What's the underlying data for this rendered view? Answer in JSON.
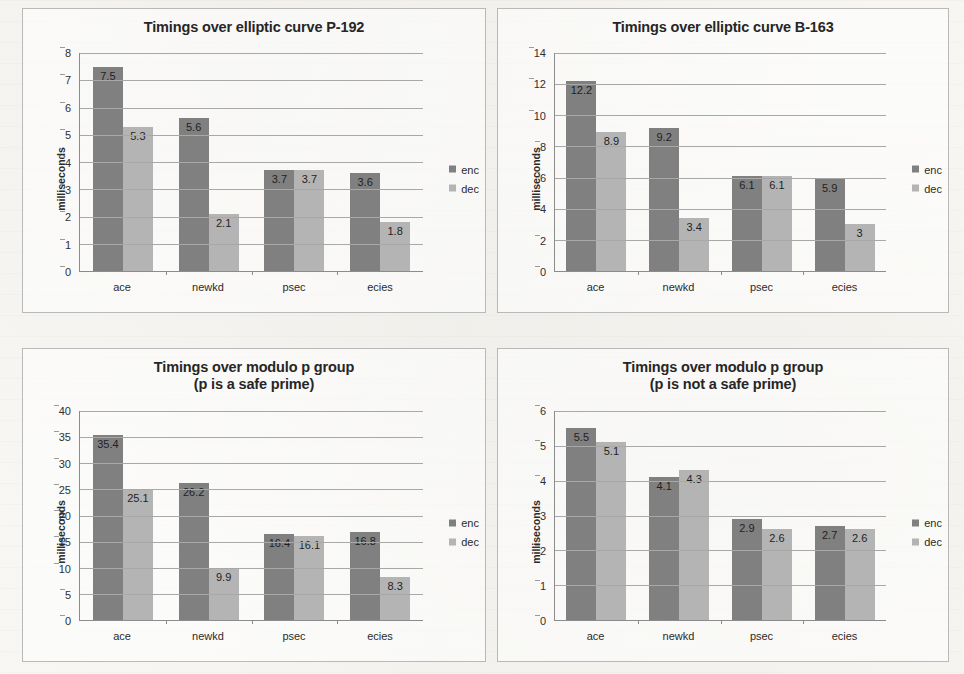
{
  "legend": {
    "enc_label": "enc",
    "dec_label": "dec"
  },
  "colors": {
    "enc": "#808080",
    "dec": "#b4b4b4",
    "panel_border": "#b9b9b9",
    "grid": "#a8a8a8",
    "axis": "#8c8c8c",
    "page_bg": "#f7f6f3"
  },
  "charts": [
    {
      "id": "elliptic-p192",
      "title": "Timings over elliptic curve P-192",
      "ylabel": "milliseconds",
      "chart_data": {
        "type": "bar",
        "title": "Timings over elliptic curve P-192",
        "xlabel": "",
        "ylabel": "milliseconds",
        "categories": [
          "ace",
          "newkd",
          "psec",
          "ecies"
        ],
        "series": [
          {
            "name": "enc",
            "values": [
              7.5,
              5.6,
              3.7,
              3.6
            ]
          },
          {
            "name": "dec",
            "values": [
              5.3,
              2.1,
              3.7,
              1.8
            ]
          }
        ],
        "ylim": [
          0,
          8
        ],
        "yticks": [
          0,
          1,
          2,
          3,
          4,
          5,
          6,
          7,
          8
        ],
        "grid": true,
        "legend_position": "right"
      }
    },
    {
      "id": "elliptic-b163",
      "title": "Timings over elliptic curve B-163",
      "ylabel": "milliseconds",
      "chart_data": {
        "type": "bar",
        "title": "Timings over elliptic curve B-163",
        "xlabel": "",
        "ylabel": "milliseconds",
        "categories": [
          "ace",
          "newkd",
          "psec",
          "ecies"
        ],
        "series": [
          {
            "name": "enc",
            "values": [
              12.2,
              9.2,
              6.1,
              5.9
            ]
          },
          {
            "name": "dec",
            "values": [
              8.9,
              3.4,
              6.1,
              3
            ]
          }
        ],
        "ylim": [
          0,
          14
        ],
        "yticks": [
          0,
          2,
          4,
          6,
          8,
          10,
          12,
          14
        ],
        "grid": true,
        "legend_position": "right"
      }
    },
    {
      "id": "modulo-safe-prime",
      "title": "Timings over modulo p group\n(p is a safe prime)",
      "ylabel": "milliseconds",
      "chart_data": {
        "type": "bar",
        "title": "Timings over modulo p group (p is a safe prime)",
        "xlabel": "",
        "ylabel": "milliseconds",
        "categories": [
          "ace",
          "newkd",
          "psec",
          "ecies"
        ],
        "series": [
          {
            "name": "enc",
            "values": [
              35.4,
              26.2,
              16.4,
              16.8
            ]
          },
          {
            "name": "dec",
            "values": [
              25.1,
              9.9,
              16.1,
              8.3
            ]
          }
        ],
        "ylim": [
          0,
          40
        ],
        "yticks": [
          0,
          5,
          10,
          15,
          20,
          25,
          30,
          35,
          40
        ],
        "grid": true,
        "legend_position": "right"
      }
    },
    {
      "id": "modulo-not-safe-prime",
      "title": "Timings over modulo p group\n(p is not a safe prime)",
      "ylabel": "milliseconds",
      "chart_data": {
        "type": "bar",
        "title": "Timings over modulo p group (p is not a safe prime)",
        "xlabel": "",
        "ylabel": "milliseconds",
        "categories": [
          "ace",
          "newkd",
          "psec",
          "ecies"
        ],
        "series": [
          {
            "name": "enc",
            "values": [
              5.5,
              4.1,
              2.9,
              2.7
            ]
          },
          {
            "name": "dec",
            "values": [
              5.1,
              4.3,
              2.6,
              2.6
            ]
          }
        ],
        "ylim": [
          0,
          6
        ],
        "yticks": [
          0,
          1,
          2,
          3,
          4,
          5,
          6
        ],
        "grid": true,
        "legend_position": "right"
      }
    }
  ]
}
